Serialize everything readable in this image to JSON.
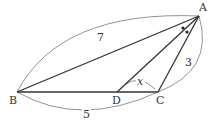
{
  "diagram": {
    "type": "triangle-angle-bisector",
    "points": {
      "A": {
        "label": "A",
        "x": 199,
        "y": 16
      },
      "B": {
        "label": "B",
        "x": 17,
        "y": 92
      },
      "C": {
        "label": "C",
        "x": 158,
        "y": 92
      },
      "D": {
        "label": "D",
        "x": 117,
        "y": 92
      }
    },
    "segments": [
      {
        "from": "A",
        "to": "B"
      },
      {
        "from": "A",
        "to": "C"
      },
      {
        "from": "A",
        "to": "D"
      },
      {
        "from": "B",
        "to": "C"
      }
    ],
    "measurements": {
      "AB": "7",
      "AC": "3",
      "BC": "5"
    },
    "angle_label": "x",
    "angle_marks": "equal angles BAD and DAC (dots)",
    "colors": {
      "stroke": "#333333",
      "arc": "#777777",
      "background": "#ffffff"
    }
  }
}
